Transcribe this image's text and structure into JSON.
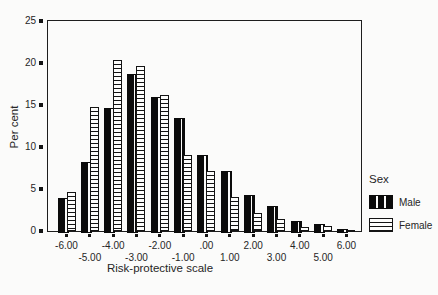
{
  "figure": {
    "background_color": "#fbfbfa",
    "frame_color": "#1d1d1d",
    "bar_color_male": "#0b0b0b",
    "bar_pattern_female": "horizontal-stripes"
  },
  "chart_data": {
    "type": "bar",
    "xlabel": "Risk-protective scale",
    "ylabel": "Per cent",
    "ylim": [
      0,
      25
    ],
    "yticks": [
      0,
      5,
      10,
      15,
      20,
      25
    ],
    "grid": false,
    "legend_title": "Sex",
    "legend_position": "right",
    "x_labels_staggered": true,
    "categories": [
      "-6.00",
      "-5.00",
      "-4.00",
      "-3.00",
      "-2.00",
      "-1.00",
      ".00",
      "1.00",
      "2.00",
      "3.00",
      "4.00",
      "5.00",
      "6.00"
    ],
    "series": [
      {
        "name": "Male",
        "fill": "solid-black",
        "values": [
          3.9,
          8.2,
          14.6,
          18.7,
          16.0,
          13.5,
          9.0,
          7.2,
          4.3,
          3.0,
          1.2,
          0.8,
          0.2
        ]
      },
      {
        "name": "Female",
        "fill": "horizontal-stripes",
        "values": [
          4.6,
          14.8,
          20.3,
          19.6,
          16.2,
          9.1,
          7.2,
          4.1,
          2.1,
          1.4,
          0.5,
          0.6,
          0.1
        ]
      }
    ]
  }
}
